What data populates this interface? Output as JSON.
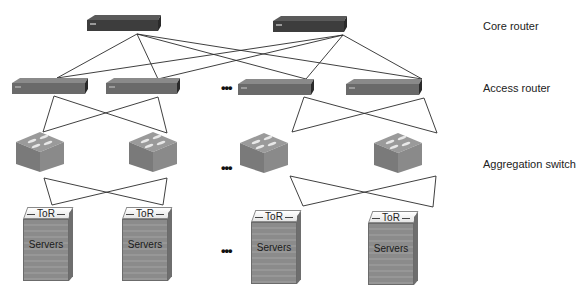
{
  "diagram": {
    "layers": [
      {
        "id": "core",
        "label": "Core router",
        "y": 27
      },
      {
        "id": "access",
        "label": "Access router",
        "y": 88
      },
      {
        "id": "aggregation",
        "label": "Aggregation switch",
        "y": 165
      }
    ],
    "core_routers": [
      {
        "id": "core-1",
        "x": 87,
        "y": 15,
        "w": 74,
        "h": 16,
        "link": [
          137,
          34
        ]
      },
      {
        "id": "core-2",
        "x": 273,
        "y": 16,
        "w": 74,
        "h": 16,
        "link": [
          343,
          35
        ]
      }
    ],
    "access_routers": [
      {
        "id": "access-1",
        "x": 12,
        "y": 78,
        "w": 76,
        "h": 16,
        "top": [
          57,
          78
        ],
        "bottom": [
          54,
          96
        ]
      },
      {
        "id": "access-2",
        "x": 106,
        "y": 78,
        "w": 74,
        "h": 16,
        "top": [
          158,
          79
        ],
        "bottom": [
          158,
          97
        ]
      },
      {
        "id": "access-3",
        "x": 238,
        "y": 79,
        "w": 76,
        "h": 16,
        "top": [
          306,
          79
        ],
        "bottom": [
          304,
          97
        ]
      },
      {
        "id": "access-4",
        "x": 346,
        "y": 79,
        "w": 76,
        "h": 16,
        "top": [
          422,
          79
        ],
        "bottom": [
          424,
          98
        ]
      }
    ],
    "aggregation_switches": [
      {
        "id": "agg-1",
        "x": 16,
        "y": 132,
        "w": 48,
        "h": 42,
        "top": [
          43,
          132
        ],
        "bottom": [
          44,
          178
        ]
      },
      {
        "id": "agg-2",
        "x": 129,
        "y": 132,
        "w": 48,
        "h": 42,
        "top": [
          167,
          133
        ],
        "bottom": [
          167,
          178
        ]
      },
      {
        "id": "agg-3",
        "x": 240,
        "y": 133,
        "w": 48,
        "h": 42,
        "top": [
          292,
          132
        ],
        "bottom": [
          290,
          176
        ]
      },
      {
        "id": "agg-4",
        "x": 374,
        "y": 133,
        "w": 48,
        "h": 42,
        "top": [
          437,
          133
        ],
        "bottom": [
          436,
          176
        ]
      }
    ],
    "tor_racks": [
      {
        "id": "rack-1",
        "x": 23,
        "y": 207,
        "top_label": "ToR",
        "body_label": "Servers"
      },
      {
        "id": "rack-2",
        "x": 122,
        "y": 207,
        "top_label": "ToR",
        "body_label": "Servers"
      },
      {
        "id": "rack-3",
        "x": 251,
        "y": 210,
        "top_label": "ToR",
        "body_label": "Servers"
      },
      {
        "id": "rack-4",
        "x": 368,
        "y": 211,
        "top_label": "ToR",
        "body_label": "Servers"
      }
    ],
    "tor_links_top": [
      [
        52,
        205
      ],
      [
        163,
        205
      ],
      [
        303,
        206
      ],
      [
        433,
        207
      ]
    ],
    "ellipsis": [
      {
        "text": "•••",
        "x": 221,
        "y": 83
      },
      {
        "text": "•••",
        "x": 221,
        "y": 163
      },
      {
        "text": "•••",
        "x": 221,
        "y": 246
      }
    ],
    "colors": {
      "router_dark": "#3d3d3d",
      "router_top": "#5a5a5a",
      "access_router": "#6a6a6a",
      "switch_top": "#9a9a9a",
      "switch_side": "#7a7a7a",
      "link": "#2a2a2a"
    }
  }
}
